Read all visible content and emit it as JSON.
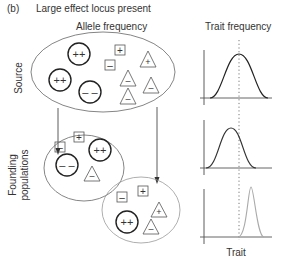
{
  "panel_label": "(b)",
  "title": "Large effect locus present",
  "headers": {
    "allele": "Allele frequency",
    "trait": "Trait frequency"
  },
  "row_labels": {
    "source": "Source",
    "founding_line1": "Founding",
    "founding_line2": "populations"
  },
  "x_axis_label": "Trait",
  "symbols": {
    "circle_pp": "++",
    "circle_mm": "– –",
    "square_p": "+",
    "square_m": "–",
    "triangle_p": "+",
    "triangle_m": "–"
  },
  "populations": [
    {
      "name": "source",
      "circles": [
        "++",
        "++",
        "– –"
      ],
      "squares": [
        "+",
        "–"
      ],
      "triangles": [
        "+",
        "–",
        "–",
        "–"
      ]
    },
    {
      "name": "founding-1",
      "circles": [
        "++",
        "– –"
      ],
      "squares": [
        "+",
        "–"
      ],
      "triangles": [
        "–"
      ]
    },
    {
      "name": "founding-2",
      "circles": [
        "++"
      ],
      "squares": [
        "+",
        "–"
      ],
      "triangles": [
        "+",
        "–"
      ]
    }
  ],
  "colors": {
    "dark_curve": "#333333",
    "light_curve": "#999999",
    "outline": "#888888"
  }
}
